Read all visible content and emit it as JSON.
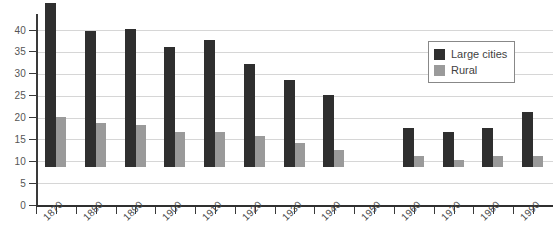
{
  "chart_data": {
    "type": "bar",
    "title": "",
    "xlabel": "",
    "ylabel": "",
    "ylim": [
      0,
      40
    ],
    "yticks": [
      0,
      5,
      10,
      15,
      20,
      25,
      30,
      35,
      40
    ],
    "grid": true,
    "legend_position": "upper-right",
    "categories": [
      "1870",
      "1880",
      "1890",
      "1900",
      "1910",
      "1920",
      "1930",
      "1940",
      "1950",
      "1960",
      "1970",
      "1980",
      "1990"
    ],
    "series": [
      {
        "name": "Large cities",
        "color": "#2f2f2f",
        "values": [
          37.5,
          31,
          31.5,
          27.5,
          29,
          23.5,
          20,
          16.5,
          0,
          9,
          8,
          9,
          12.5
        ]
      },
      {
        "name": "Rural",
        "color": "#9a9a9a",
        "values": [
          11.5,
          10,
          9.5,
          8,
          8,
          7,
          5.5,
          4,
          0,
          2.5,
          1.5,
          2.5,
          2.5
        ]
      }
    ]
  },
  "legend": {
    "items": [
      {
        "label": "Large cities",
        "swatch": "large"
      },
      {
        "label": "Rural",
        "swatch": "rural"
      }
    ]
  },
  "colors": {
    "large_cities": "#2f2f2f",
    "rural": "#9a9a9a",
    "gridline": "#d6d6d6",
    "axis": "#2f2f2f",
    "background": "#ffffff"
  }
}
